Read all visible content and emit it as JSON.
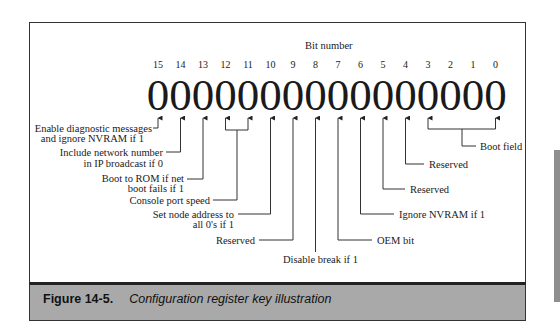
{
  "diagram": {
    "bit_number_title": "Bit number",
    "bits": [
      "15",
      "14",
      "13",
      "12",
      "11",
      "10",
      "9",
      "8",
      "7",
      "6",
      "5",
      "4",
      "3",
      "2",
      "1",
      "0"
    ],
    "values": [
      "0",
      "0",
      "0",
      "0",
      "0",
      "0",
      "0",
      "0",
      "0",
      "0",
      "0",
      "0",
      "0",
      "0",
      "0",
      "0"
    ],
    "labels": {
      "bit15_line1": "Enable diagnostic messages",
      "bit15_line2": "and ignore NVRAM if 1",
      "bit14_line1": "Include network number",
      "bit14_line2": "in IP broadcast if 0",
      "bit13_line1": "Boot to ROM if net",
      "bit13_line2": "boot fails if 1",
      "bits12_11": "Console port speed",
      "bit10_line1": "Set node address to",
      "bit10_line2": "all 0's if 1",
      "bit9": "Reserved",
      "bit8": "Disable break if 1",
      "bit7": "OEM bit",
      "bit6": "Ignore NVRAM if 1",
      "bit5": "Reserved",
      "bit4": "Reserved",
      "bits3_0": "Boot field"
    }
  },
  "caption": {
    "figure": "Figure 14-5.",
    "title": "Configuration register key illustration"
  }
}
